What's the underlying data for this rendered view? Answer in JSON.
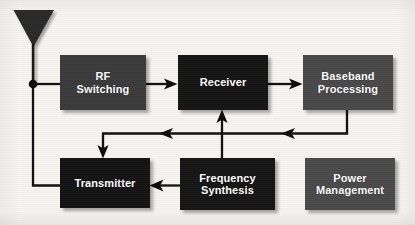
{
  "diagram": {
    "background_color": "#f4f3f0",
    "line_color": "#111111",
    "text_color": "#ffffff"
  },
  "antenna": {
    "label": "antenna",
    "shape": "inverted-triangle-dipole",
    "color": "#2a2a2a"
  },
  "blocks": [
    {
      "id": "rf-switching",
      "label": "RF\nSwitching",
      "line1": "RF",
      "line2": "Switching",
      "color": "#3b3b3b",
      "x": 60,
      "y": 55,
      "w": 86,
      "h": 55
    },
    {
      "id": "receiver",
      "label": "Receiver",
      "line1": "Receiver",
      "line2": "",
      "color": "#151515",
      "x": 178,
      "y": 55,
      "w": 90,
      "h": 55
    },
    {
      "id": "baseband-processing",
      "label": "Baseband\nProcessing",
      "line1": "Baseband",
      "line2": "Processing",
      "color": "#494949",
      "x": 303,
      "y": 55,
      "w": 90,
      "h": 55
    },
    {
      "id": "transmitter",
      "label": "Transmitter",
      "line1": "Transmitter",
      "line2": "",
      "color": "#141414",
      "x": 60,
      "y": 158,
      "w": 90,
      "h": 50
    },
    {
      "id": "frequency-synthesis",
      "label": "Frequency\nSynthesis",
      "line1": "Frequency",
      "line2": "Synthesis",
      "color": "#161616",
      "x": 180,
      "y": 158,
      "w": 95,
      "h": 52
    },
    {
      "id": "power-management",
      "label": "Power\nManagement",
      "line1": "Power",
      "line2": "Management",
      "color": "#4a4a4a",
      "x": 305,
      "y": 158,
      "w": 90,
      "h": 52
    }
  ],
  "connections": [
    {
      "id": "antenna-to-junction",
      "from": "antenna",
      "to": "junction",
      "arrow": false
    },
    {
      "id": "junction-to-rf-switching",
      "from": "junction",
      "to": "rf-switching",
      "arrow": false
    },
    {
      "id": "junction-to-transmitter",
      "from": "junction",
      "to": "transmitter",
      "arrow": false
    },
    {
      "id": "rf-switching-to-receiver",
      "from": "rf-switching",
      "to": "receiver",
      "arrow": true
    },
    {
      "id": "receiver-to-baseband",
      "from": "receiver",
      "to": "baseband-processing",
      "arrow": true
    },
    {
      "id": "baseband-to-feedback-bus",
      "from": "baseband-processing",
      "to": "feedback-bus",
      "arrow": true
    },
    {
      "id": "feedback-bus-to-transmitter",
      "from": "feedback-bus",
      "to": "transmitter",
      "arrow": true
    },
    {
      "id": "frequency-synthesis-to-receiver",
      "from": "frequency-synthesis",
      "to": "receiver",
      "arrow": true
    },
    {
      "id": "frequency-synthesis-to-transmitter",
      "from": "frequency-synthesis",
      "to": "transmitter",
      "arrow": true
    }
  ]
}
